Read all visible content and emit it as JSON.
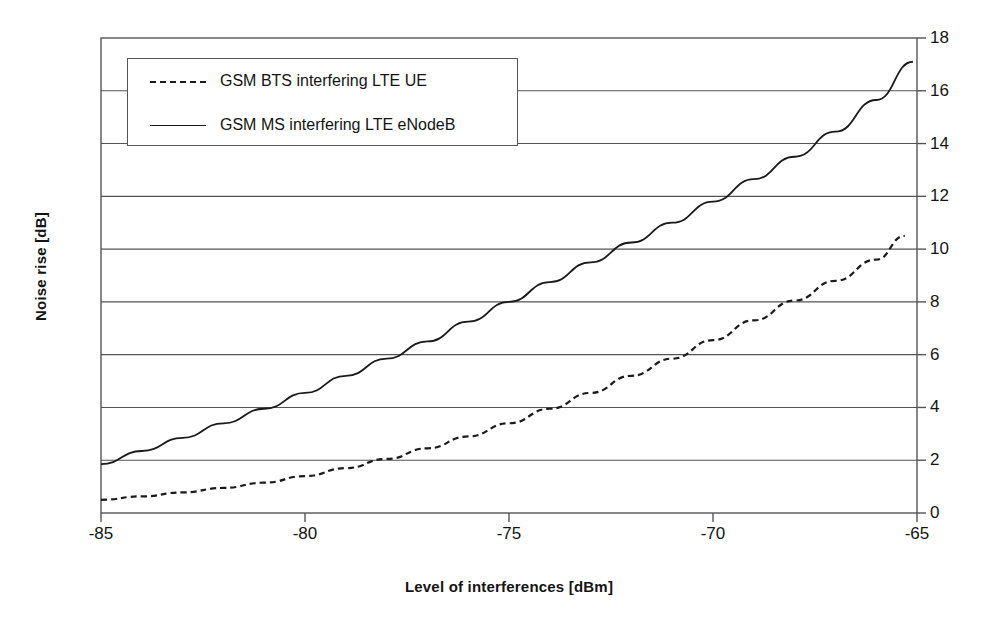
{
  "chart_data": {
    "type": "line",
    "title": "",
    "xlabel": "Level of interferences [dBm]",
    "ylabel": "Noise rise [dB]",
    "xlim": [
      -85,
      -65
    ],
    "ylim": [
      0,
      18
    ],
    "xticks": [
      -85,
      -80,
      -75,
      -70,
      -65
    ],
    "xtick_labels": [
      "-85",
      "-80",
      "-75",
      "-70",
      "-65"
    ],
    "yticks": [
      0,
      2,
      4,
      6,
      8,
      10,
      12,
      14,
      16,
      18
    ],
    "ytick_labels": [
      "0",
      "2",
      "4",
      "6",
      "8",
      "10",
      "12",
      "14",
      "16",
      "18"
    ],
    "grid": "horizontal",
    "y_axis_side": "right",
    "legend_position": "top-left-inside",
    "series": [
      {
        "name": "GSM BTS interfering LTE UE",
        "style": "dashed",
        "color": "#1a1a1a",
        "x": [
          -85,
          -84,
          -83,
          -82,
          -81,
          -80,
          -79,
          -78,
          -77,
          -76,
          -75,
          -74,
          -73,
          -72,
          -71,
          -70,
          -69,
          -68,
          -67,
          -66,
          -65.3
        ],
        "y": [
          0.5,
          0.63,
          0.78,
          0.95,
          1.15,
          1.4,
          1.7,
          2.05,
          2.45,
          2.9,
          3.4,
          3.95,
          4.55,
          5.2,
          5.85,
          6.55,
          7.3,
          8.05,
          8.8,
          9.6,
          10.5
        ]
      },
      {
        "name": "GSM MS interfering LTE eNodeB",
        "style": "solid",
        "color": "#1a1a1a",
        "x": [
          -85,
          -84,
          -83,
          -82,
          -81,
          -80,
          -79,
          -78,
          -77,
          -76,
          -75,
          -74,
          -73,
          -72,
          -71,
          -70,
          -69,
          -68,
          -67,
          -66,
          -65.1
        ],
        "y": [
          1.85,
          2.35,
          2.85,
          3.4,
          3.95,
          4.55,
          5.2,
          5.85,
          6.5,
          7.25,
          8.0,
          8.75,
          9.5,
          10.25,
          11.0,
          11.8,
          12.65,
          13.5,
          14.45,
          15.65,
          17.1
        ]
      }
    ]
  },
  "legend": {
    "entries": [
      {
        "label": "GSM BTS interfering LTE UE",
        "style": "dashed"
      },
      {
        "label": "GSM MS interfering LTE eNodeB",
        "style": "solid"
      }
    ]
  }
}
